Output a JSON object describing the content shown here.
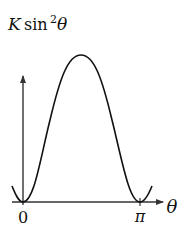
{
  "diagram": {
    "type": "function-plot",
    "y_label": {
      "coef": "K",
      "func": "sin",
      "power": "2",
      "var": "θ"
    },
    "x_label": "θ",
    "ticks": [
      {
        "label": "0",
        "value": 0
      },
      {
        "label": "π",
        "value": 3.14159
      }
    ],
    "curve": "K sin²θ, over slightly beyond [0, π]",
    "colors": {
      "stroke": "#111111",
      "axis": "#333333",
      "background": "#ffffff"
    }
  }
}
